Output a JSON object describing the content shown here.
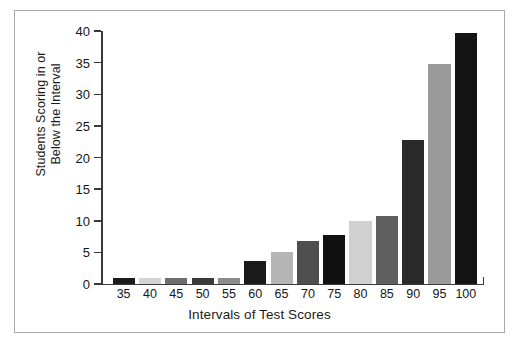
{
  "chart_data": {
    "type": "bar",
    "title": "",
    "xlabel": "Intervals of Test Scores",
    "ylabel_lines": [
      "Students Scoring in or",
      "Below the Interval"
    ],
    "ylabel": "Students Scoring in or Below the Interval",
    "categories": [
      "35",
      "40",
      "45",
      "50",
      "55",
      "60",
      "65",
      "70",
      "75",
      "80",
      "85",
      "90",
      "95",
      "100"
    ],
    "values": [
      1,
      1,
      1,
      1,
      1,
      3.7,
      5,
      6.8,
      7.7,
      10,
      10.8,
      22.7,
      34.8,
      39.7
    ],
    "bar_colors": [
      "#1a1a1a",
      "#d4d4d4",
      "#6e6e6e",
      "#3a3a3a",
      "#8c8c8c",
      "#1a1a1a",
      "#b5b5b5",
      "#4f4f4f",
      "#111111",
      "#d0d0d0",
      "#5f5f5f",
      "#2a2a2a",
      "#9a9a9a",
      "#141414"
    ],
    "ylim": [
      0,
      40
    ],
    "yticks": [
      0,
      5,
      10,
      15,
      20,
      25,
      30,
      35,
      40
    ],
    "ytick_labels": [
      "0",
      "5",
      "10",
      "15",
      "20",
      "25",
      "30",
      "35",
      "40"
    ],
    "grid": false,
    "legend": false,
    "axis_color": "#3a3a3a",
    "frame_color": "#a9a9a9",
    "background": "#ffffff"
  }
}
